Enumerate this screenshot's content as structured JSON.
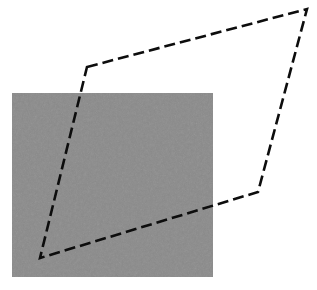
{
  "canvas": {
    "width": 317,
    "height": 290,
    "background_color": "#ffffff"
  },
  "shapes": {
    "gray_rectangle": {
      "label": "gray-textured-rectangle",
      "fill_color": "#8a8a8a",
      "x": 12,
      "y": 93,
      "width": 201,
      "height": 184,
      "texture": "fine-grain-noise",
      "stroke": "none"
    },
    "dashed_quadrilateral": {
      "label": "dashed-quadrilateral-outline",
      "stroke_color": "#0d0d0d",
      "stroke_width": 2.6,
      "dash_length": 11,
      "dash_gap": 5,
      "fill": "none",
      "points": "87,67 307,9 258,192 40,258",
      "vertices": [
        {
          "name": "top-left-vertex",
          "x": 87,
          "y": 67
        },
        {
          "name": "top-right-vertex",
          "x": 307,
          "y": 9
        },
        {
          "name": "bottom-right-vertex",
          "x": 258,
          "y": 192
        },
        {
          "name": "bottom-left-vertex",
          "x": 40,
          "y": 258
        }
      ]
    }
  }
}
